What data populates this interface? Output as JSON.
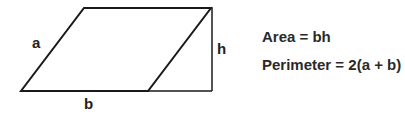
{
  "diagram": {
    "shape": "parallelogram",
    "labels": {
      "side": "a",
      "base": "b",
      "height": "h"
    },
    "stroke_color": "#1a1a1a"
  },
  "formulas": {
    "area": "Area = bh",
    "perimeter": "Perimeter = 2(a + b)"
  }
}
